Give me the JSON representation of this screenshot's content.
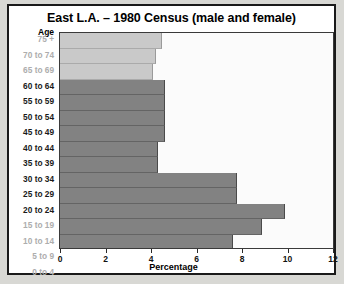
{
  "chart_data": {
    "type": "bar",
    "orientation": "horizontal",
    "title": "East L.A. – 1980 Census (male and female)",
    "xlabel": "Percentage",
    "ylabel": "Age",
    "xlim": [
      0,
      12
    ],
    "xticks": [
      0,
      2,
      4,
      6,
      8,
      10,
      12
    ],
    "xtick_labels": [
      "0",
      "2",
      "4",
      "6",
      "8",
      "10",
      "12"
    ],
    "grid": false,
    "legend": null,
    "categories": [
      "75 +",
      "70 to 74",
      "65 to 69",
      "60 to 64",
      "55 to 59",
      "50 to 54",
      "45 to 49",
      "40 to 44",
      "35 to 39",
      "30 to 34",
      "25 to 29",
      "20 to 24",
      "15 to 19",
      "10 to 14",
      "5 to 9",
      "0 to 4"
    ],
    "values": [
      4.5,
      4.2,
      4.1,
      4.6,
      4.6,
      4.6,
      4.6,
      4.3,
      4.3,
      7.8,
      7.8,
      9.9,
      8.9,
      7.6,
      8.0,
      9.3
    ],
    "bar_styles": [
      "light",
      "light",
      "light",
      "dark",
      "dark",
      "dark",
      "dark",
      "dark",
      "dark",
      "dark",
      "dark",
      "dark",
      "dark",
      "dark",
      "dark",
      "dark"
    ],
    "label_styles": [
      "muted",
      "muted",
      "muted",
      "normal",
      "normal",
      "normal",
      "normal",
      "normal",
      "normal",
      "normal",
      "normal",
      "normal",
      "muted",
      "muted",
      "muted",
      "muted"
    ],
    "colors": {
      "bar_light": "#c9c9c9",
      "bar_dark": "#828282",
      "frame": "#1a1a1a",
      "plot_background": "#fbfbfb",
      "page_background": "#d8d8d4",
      "label_muted": "#adadad",
      "label_normal": "#1a1a1a"
    }
  }
}
